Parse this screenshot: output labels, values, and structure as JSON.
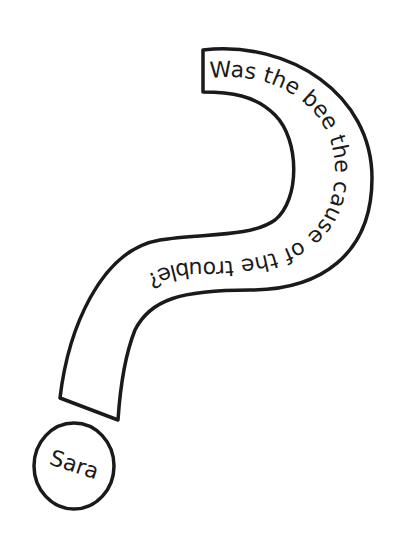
{
  "question_mark": {
    "text": "Was the bee the cause of the trouble?"
  },
  "author_circle": {
    "name": "Sara"
  },
  "colors": {
    "ink": "#1a1a1a",
    "paper": "#ffffff"
  }
}
